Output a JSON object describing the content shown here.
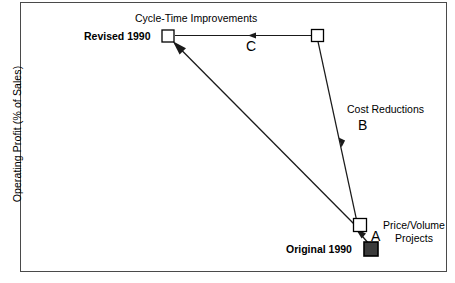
{
  "figure": {
    "type": "diagram",
    "frame": {
      "x": 20,
      "y": 2,
      "width": 427,
      "height": 270,
      "border_color": "#4a4a4a"
    },
    "axes": {
      "y_title": "Operating Profit (% of Sales)",
      "x_title": ""
    },
    "nodes": [
      {
        "id": "revised-1990",
        "label": "Revised 1990",
        "label_bold": true,
        "marker": "open-square",
        "fill": "#ffffff",
        "stroke": "#000000",
        "x": 168,
        "y": 36,
        "size": 12
      },
      {
        "id": "waypoint-top-right",
        "label": "",
        "marker": "open-square",
        "fill": "#ffffff",
        "stroke": "#000000",
        "x": 317.5,
        "y": 35.5,
        "size": 12
      },
      {
        "id": "waypoint-bottom",
        "label": "",
        "marker": "open-square",
        "fill": "#ffffff",
        "stroke": "#000000",
        "x": 360,
        "y": 225,
        "size": 13
      },
      {
        "id": "original-1990",
        "label": "Original 1990",
        "label_bold": true,
        "marker": "filled-square",
        "fill": "#3b3b3b",
        "stroke": "#000000",
        "x": 371,
        "y": 249,
        "size": 14
      }
    ],
    "arrows": [
      {
        "id": "arrow-a",
        "key": "A",
        "label": "Price/Volume Projects",
        "label_line1": "Price/Volume",
        "label_line2": "Projects",
        "from": "original-1990",
        "to": "waypoint-bottom",
        "direction": "up-left"
      },
      {
        "id": "arrow-b",
        "key": "B",
        "label": "Cost Reductions",
        "from": "waypoint-top-right",
        "to": "waypoint-bottom",
        "direction": "down"
      },
      {
        "id": "arrow-c",
        "key": "C",
        "label": "Cycle-Time Improvements",
        "from": "waypoint-top-right",
        "to": "revised-1990",
        "direction": "left"
      },
      {
        "id": "arrow-main",
        "key": "",
        "label": "",
        "from": "waypoint-bottom",
        "to": "revised-1990",
        "direction": "up-left"
      }
    ],
    "labels": {
      "cycle_time": "Cycle-Time Improvements",
      "revised_1990": "Revised 1990",
      "c_key": "C",
      "cost_reductions": "Cost Reductions",
      "b_key": "B",
      "a_key": "A",
      "price_volume_line1": "Price/Volume",
      "price_volume_line2": "Projects",
      "original_1990": "Original 1990"
    },
    "colors": {
      "line": "#1a1a1a",
      "frame": "#4a4a4a",
      "marker_fill_open": "#ffffff",
      "marker_fill_solid": "#3b3b3b",
      "text": "#000000",
      "background": "#ffffff"
    }
  }
}
